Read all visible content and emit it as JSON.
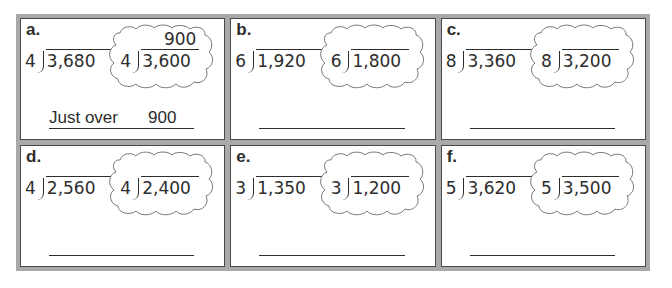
{
  "worksheet": {
    "problems": [
      {
        "label": "a.",
        "divisor": "4",
        "dividend": "3,680",
        "estimate": {
          "divisor": "4",
          "dividend": "3,600",
          "quotient": "900"
        },
        "answer": {
          "prefix": "Just over",
          "value": "900"
        }
      },
      {
        "label": "b.",
        "divisor": "6",
        "dividend": "1,920",
        "estimate": {
          "divisor": "6",
          "dividend": "1,800",
          "quotient": ""
        },
        "answer": {
          "prefix": "",
          "value": ""
        }
      },
      {
        "label": "c.",
        "divisor": "8",
        "dividend": "3,360",
        "estimate": {
          "divisor": "8",
          "dividend": "3,200",
          "quotient": ""
        },
        "answer": {
          "prefix": "",
          "value": ""
        }
      },
      {
        "label": "d.",
        "divisor": "4",
        "dividend": "2,560",
        "estimate": {
          "divisor": "4",
          "dividend": "2,400",
          "quotient": ""
        },
        "answer": {
          "prefix": "",
          "value": ""
        }
      },
      {
        "label": "e.",
        "divisor": "3",
        "dividend": "1,350",
        "estimate": {
          "divisor": "3",
          "dividend": "1,200",
          "quotient": ""
        },
        "answer": {
          "prefix": "",
          "value": ""
        }
      },
      {
        "label": "f.",
        "divisor": "5",
        "dividend": "3,620",
        "estimate": {
          "divisor": "5",
          "dividend": "3,500",
          "quotient": ""
        },
        "answer": {
          "prefix": "",
          "value": ""
        }
      }
    ]
  },
  "colors": {
    "frame": "#a9a9a9",
    "panel_border": "#4a4a4a",
    "text": "#2d2d2d",
    "background": "#ffffff"
  }
}
